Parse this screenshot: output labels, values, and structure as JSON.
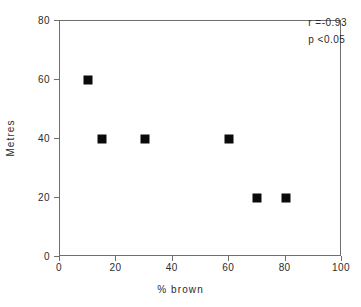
{
  "chart_data": {
    "type": "scatter",
    "title": "",
    "xlabel": "% brown",
    "ylabel": "Metres",
    "xlim": [
      0,
      100
    ],
    "ylim": [
      0,
      80
    ],
    "xticks": [
      0,
      20,
      40,
      60,
      80,
      100
    ],
    "yticks": [
      0,
      20,
      40,
      60,
      80
    ],
    "xticklabels": [
      "0",
      "20",
      "40",
      "60",
      "80",
      "100"
    ],
    "yticklabels": [
      "0",
      "20",
      "40",
      "60",
      "80"
    ],
    "grid": false,
    "legend": null,
    "marker": {
      "shape": "square",
      "color": "#0a0a0a",
      "size_px": 9
    },
    "points": [
      {
        "x": 10,
        "y": 60
      },
      {
        "x": 15,
        "y": 40
      },
      {
        "x": 30,
        "y": 40
      },
      {
        "x": 60,
        "y": 40
      },
      {
        "x": 70,
        "y": 20
      },
      {
        "x": 80,
        "y": 20
      }
    ],
    "annotations": [
      {
        "text": "r =-0.93"
      },
      {
        "text": "p <0.05"
      }
    ],
    "statistics": {
      "r": "-0.93",
      "p": "<0.05"
    }
  },
  "figure": {
    "background": "#ffffff",
    "frame_color": "#6e6e6e"
  }
}
